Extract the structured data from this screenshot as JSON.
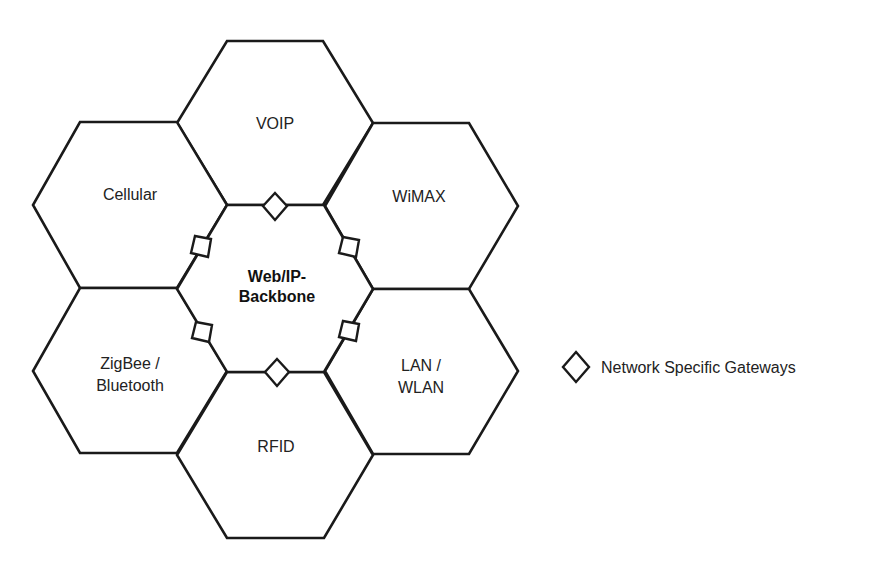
{
  "diagram": {
    "center": {
      "line1": "Web/IP-",
      "line2": "Backbone"
    },
    "networks": {
      "voip": {
        "line1": "VOIP"
      },
      "cellular": {
        "line1": "Cellular"
      },
      "wimax": {
        "line1": "WiMAX"
      },
      "zigbee": {
        "line1": "ZigBee /",
        "line2": "Bluetooth"
      },
      "lan": {
        "line1": "LAN /",
        "line2": "WLAN"
      },
      "rfid": {
        "line1": "RFID"
      }
    },
    "gateway_count": 6
  },
  "legend": {
    "symbol": "diamond-icon",
    "label": "Network Specific Gateways"
  },
  "colors": {
    "stroke": "#1a1a1a",
    "text": "#222222",
    "background": "#ffffff"
  }
}
